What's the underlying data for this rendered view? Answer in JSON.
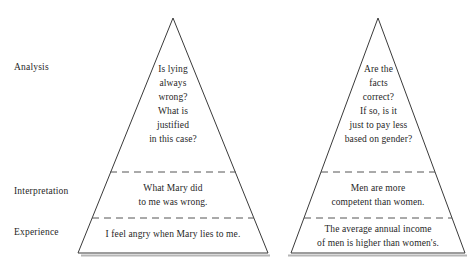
{
  "diagram": {
    "type": "two-pyramid-levels-of-thinking",
    "stage_labels": [
      {
        "id": "analysis",
        "label": "Analysis"
      },
      {
        "id": "interpretation",
        "label": "Interpretation"
      },
      {
        "id": "experience",
        "label": "Experience"
      }
    ],
    "colors": {
      "outline": "#3a3a3a",
      "divider": "#555555",
      "shadow": "#b0b0b0",
      "text": "#1f1f1f",
      "background": "#ffffff"
    },
    "pyramids": [
      {
        "id": "left-pyramid",
        "levels": {
          "analysis": [
            "Is lying",
            "always",
            "wrong?",
            "What is",
            "justified",
            "in this case?"
          ],
          "interpretation": [
            "What Mary did",
            "to me was wrong."
          ],
          "experience": [
            "I feel angry when Mary lies to me."
          ]
        }
      },
      {
        "id": "right-pyramid",
        "levels": {
          "analysis": [
            "Are the",
            "facts",
            "correct?",
            "If so, is it",
            "just to pay less",
            "based on gender?"
          ],
          "interpretation": [
            "Men are more",
            "competent than women."
          ],
          "experience": [
            "The average annual income",
            "of men is higher than women's."
          ]
        }
      }
    ]
  }
}
